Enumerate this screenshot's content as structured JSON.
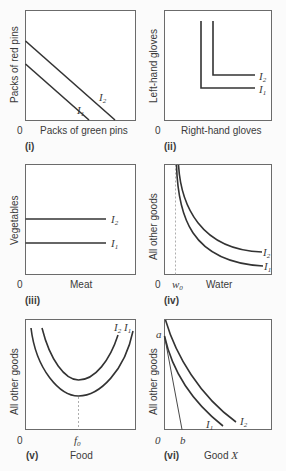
{
  "panels": [
    {
      "id": "i",
      "label": "(i)",
      "origin": "0",
      "xlabel": "Packs of green pins",
      "ylabel": "Packs of red pins",
      "curves": [
        {
          "name": "I",
          "sub": "1"
        },
        {
          "name": "I",
          "sub": "2"
        }
      ],
      "shape": "perfect-substitutes"
    },
    {
      "id": "ii",
      "label": "(ii)",
      "origin": "0",
      "xlabel": "Right-hand gloves",
      "ylabel": "Left-hand gloves",
      "curves": [
        {
          "name": "I",
          "sub": "2"
        },
        {
          "name": "I",
          "sub": "1"
        }
      ],
      "shape": "perfect-complements"
    },
    {
      "id": "iii",
      "label": "(iii)",
      "origin": "0",
      "xlabel": "Meat",
      "ylabel": "Vegetables",
      "curves": [
        {
          "name": "I",
          "sub": "2"
        },
        {
          "name": "I",
          "sub": "1"
        }
      ],
      "shape": "horizontal-lines"
    },
    {
      "id": "iv",
      "label": "(iv)",
      "origin": "0",
      "xlabel": "Water",
      "ylabel": "All other goods",
      "xmark": {
        "name": "w",
        "sub": "0"
      },
      "curves": [
        {
          "name": "I",
          "sub": "2"
        },
        {
          "name": "I",
          "sub": "1"
        }
      ],
      "shape": "asymptotic-convex"
    },
    {
      "id": "v",
      "label": "(v)",
      "origin": "0",
      "xlabel": "Food",
      "ylabel": "All other goods",
      "xmark": {
        "name": "f",
        "sub": "0"
      },
      "curves": [
        {
          "name": "I",
          "sub": "2"
        },
        {
          "name": "I",
          "sub": "1"
        }
      ],
      "shape": "u-shaped"
    },
    {
      "id": "vi",
      "label": "(vi)",
      "origin": "0",
      "xlabel": "Good X",
      "xlabel_plain": "Good ",
      "xlabel_var": "X",
      "ylabel": "All other goods",
      "ymark": "a",
      "xmark": "b",
      "curves": [
        {
          "name": "I",
          "sub": "1"
        },
        {
          "name": "I",
          "sub": "2"
        }
      ],
      "shape": "convex-with-budget-line"
    }
  ]
}
